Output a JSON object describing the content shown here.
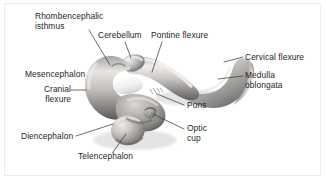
{
  "figure": {
    "type": "anatomical-illustration",
    "background_color": "#ffffff",
    "frame_color": "#eceded",
    "text_color": "#231f20",
    "leader_line_color": "#3b3b3b",
    "illustration": {
      "name": "embryonic-brain",
      "rendering": "grayscale shaded photograph-like drawing",
      "palette": {
        "highlight": "#f2f1ef",
        "light": "#d9d7d4",
        "mid": "#a9a7a4",
        "shadow": "#6e6c6a",
        "deep_shadow": "#4a4947"
      }
    },
    "labels": [
      {
        "id": "rhombencephalic-isthmus",
        "line1": "Rhombencephalic",
        "line2": "isthmus",
        "x": 35,
        "y": 12,
        "align": "left"
      },
      {
        "id": "cerebellum",
        "line1": "Cerebellum",
        "line2": "",
        "x": 98,
        "y": 31,
        "align": "left"
      },
      {
        "id": "pontine-flexure",
        "line1": "Pontine flexure",
        "line2": "",
        "x": 151,
        "y": 31,
        "align": "left"
      },
      {
        "id": "cervical-flexure",
        "line1": "Cervical flexure",
        "line2": "",
        "x": 245,
        "y": 54,
        "align": "left"
      },
      {
        "id": "mesencephalon",
        "line1": "Mesencephalon",
        "line2": "",
        "x": 25,
        "y": 70,
        "align": "left"
      },
      {
        "id": "medulla-oblongata",
        "line1": "Medulla",
        "line2": "oblongata",
        "x": 245,
        "y": 72,
        "align": "left"
      },
      {
        "id": "cranial-flexure",
        "line1": "Cranial",
        "line2": "flexure",
        "x": 41,
        "y": 86,
        "align": "left"
      },
      {
        "id": "pons",
        "line1": "Pons",
        "line2": "",
        "x": 186,
        "y": 102,
        "align": "left"
      },
      {
        "id": "optic-cup",
        "line1": "Optic",
        "line2": "cup",
        "x": 186,
        "y": 124,
        "align": "left"
      },
      {
        "id": "diencephalon",
        "line1": "Diencephalon",
        "line2": "",
        "x": 21,
        "y": 134,
        "align": "left"
      },
      {
        "id": "telencephalon",
        "line1": "Telencephalon",
        "line2": "",
        "x": 78,
        "y": 153,
        "align": "left"
      }
    ],
    "leader_lines": [
      {
        "id": "leader-rhombencephalic-isthmus",
        "points": "89,30 110,65"
      },
      {
        "id": "leader-cerebellum",
        "points": "125,42 131,58"
      },
      {
        "id": "leader-pontine-flexure",
        "points": "162,42 152,72"
      },
      {
        "id": "leader-cervical-flexure",
        "points": "243,57 224,62"
      },
      {
        "id": "leader-medulla-oblongata",
        "points": "243,76 220,78"
      },
      {
        "id": "leader-cranial-flexure",
        "points": "71,90 86,90"
      },
      {
        "id": "leader-pons",
        "points": "184,106 157,94"
      },
      {
        "id": "leader-optic-cup",
        "points": "184,130 152,114"
      },
      {
        "id": "leader-diencephalon",
        "points": "76,136 113,124"
      },
      {
        "id": "leader-telencephalon",
        "points": "113,152 125,135"
      }
    ]
  }
}
